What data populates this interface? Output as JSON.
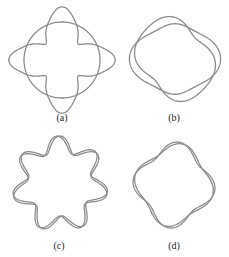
{
  "figure": {
    "stroke_color": "#8c8c8c",
    "panels": [
      {
        "id": "a",
        "label": "(a)",
        "cx": 62,
        "cy": 60,
        "base_r": 38,
        "lobes": 4,
        "amp": 14,
        "phase": -1.5708,
        "kind": "circle+lobes",
        "label_x": 62,
        "label_y": 112
      },
      {
        "id": "b",
        "label": "(b)",
        "cx": 175,
        "cy": 59,
        "base_r": 37,
        "lobes": 2,
        "amp": 6,
        "phase": 0,
        "kind": "interleaved",
        "label_x": 174,
        "label_y": 112
      },
      {
        "id": "c",
        "label": "(c)",
        "cx": 60,
        "cy": 184,
        "base_r": 40,
        "lobes": 7,
        "amp": 8,
        "phase": 0,
        "kind": "braid",
        "label_x": 59,
        "label_y": 240
      },
      {
        "id": "d",
        "label": "(d)",
        "cx": 174,
        "cy": 185,
        "base_r": 36,
        "lobes": 4,
        "amp": 3,
        "phase": 0,
        "kind": "interleaved",
        "label_x": 174,
        "label_y": 240
      }
    ]
  }
}
